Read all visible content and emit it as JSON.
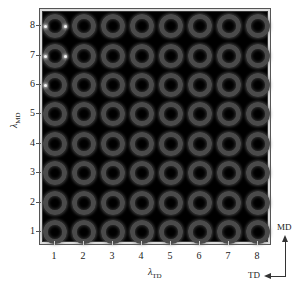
{
  "figure": {
    "type": "image-grid",
    "rows": 8,
    "cols": 8,
    "cell_content": "ring-shaped intensity pattern (annular far-field image) on black background",
    "x_axis": {
      "label_symbol": "λ",
      "label_subscript": "TD",
      "ticks": [
        "1",
        "2",
        "3",
        "4",
        "5",
        "6",
        "7",
        "8"
      ]
    },
    "y_axis": {
      "label_symbol": "λ",
      "label_subscript": "MD",
      "ticks": [
        "1",
        "2",
        "3",
        "4",
        "5",
        "6",
        "7",
        "8"
      ]
    },
    "orientation_indicator": {
      "vertical_label": "MD",
      "horizontal_label": "TD"
    },
    "bright_spots": [
      {
        "row": 8,
        "col": 1,
        "sides": [
          "left",
          "right"
        ]
      },
      {
        "row": 7,
        "col": 1,
        "sides": [
          "left",
          "right"
        ]
      },
      {
        "row": 6,
        "col": 1,
        "sides": [
          "left"
        ]
      }
    ],
    "colors": {
      "background": "#000000",
      "ring": "#4a4a4a",
      "spot": "#f4f4f4"
    }
  }
}
